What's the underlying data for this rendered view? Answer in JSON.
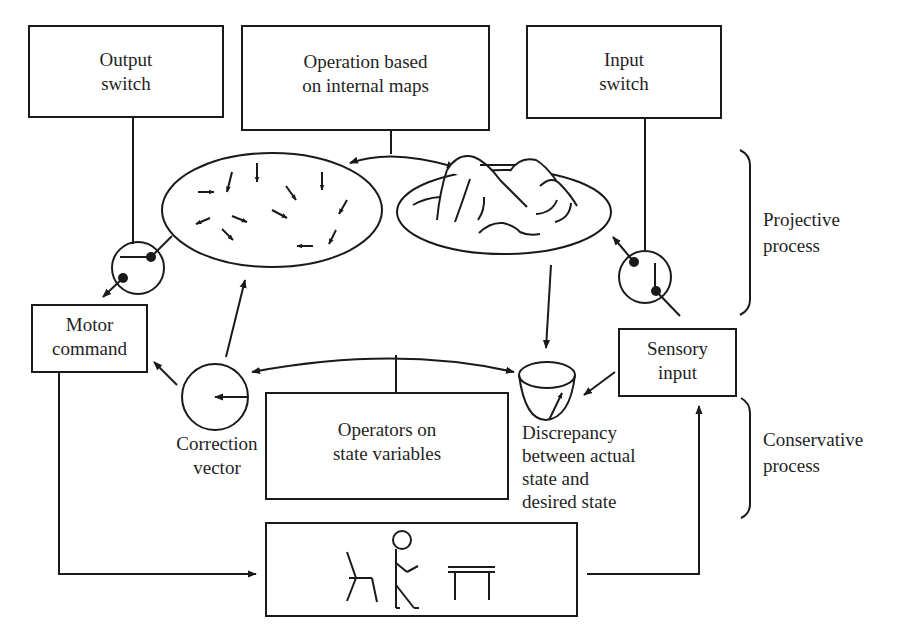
{
  "diagram": {
    "type": "control-loop schematic",
    "colors": {
      "stroke": "#1a1a1a",
      "background": "#ffffff",
      "text": "#1f1f1f"
    },
    "boxes": {
      "output_switch": {
        "line1": "Output",
        "line2": "switch"
      },
      "operation": {
        "line1": "Operation based",
        "line2": "on internal maps"
      },
      "input_switch": {
        "line1": "Input",
        "line2": "switch"
      },
      "motor_command": {
        "line1": "Motor",
        "line2": "command"
      },
      "sensory_input": {
        "line1": "Sensory",
        "line2": "input"
      },
      "operators": {
        "line1": "Operators on",
        "line2": "state variables"
      },
      "environment": {
        "icons": [
          "chair-icon",
          "stick-figure-icon",
          "table-icon"
        ]
      }
    },
    "labels": {
      "correction": {
        "line1": "Correction",
        "line2": "vector"
      },
      "discrepancy": {
        "line1": "Discrepancy",
        "line2": "between actual",
        "line3": "state and",
        "line4": "desired state"
      },
      "projective": {
        "line1": "Projective",
        "line2": "process"
      },
      "conservative": {
        "line1": "Conservative",
        "line2": "process"
      }
    },
    "nodes": [
      "vector-field-map",
      "terrain-map",
      "output-switch-circle",
      "input-switch-circle",
      "correction-vector-circle",
      "discrepancy-bowl"
    ]
  }
}
